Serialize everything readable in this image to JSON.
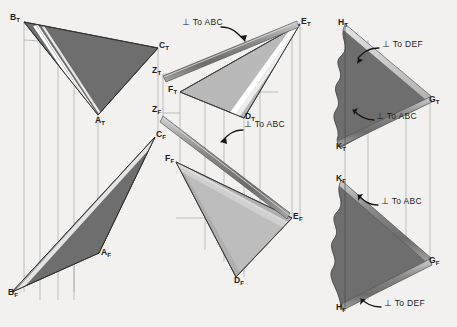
{
  "drawing": {
    "title": "Descriptive geometry: perpendicular planes orthographic projection",
    "background_color": "#f2f1ef",
    "ink_color": "#1d1d1d",
    "plane_fill_dark": "#6e6e6e",
    "plane_fill_light": "#b9b9b9",
    "edge_highlight": "#d9d9d9",
    "line_color": "#8f8f8f"
  },
  "views": {
    "left": {
      "name": "plane-abc",
      "top_view": {
        "name": "abc-top-view",
        "points": [
          {
            "label": "B",
            "sub": "T",
            "x": 16,
            "y": 17,
            "px": 24,
            "py": 22
          },
          {
            "label": "C",
            "sub": "T",
            "x": 160,
            "y": 45,
            "px": 158,
            "py": 48
          },
          {
            "label": "A",
            "sub": "T",
            "x": 99,
            "y": 111,
            "px": 98,
            "py": 115
          }
        ]
      },
      "front_view": {
        "name": "abc-front-view",
        "points": [
          {
            "label": "C",
            "sub": "F",
            "x": 157,
            "y": 134,
            "px": 155,
            "py": 137
          },
          {
            "label": "A",
            "sub": "F",
            "x": 102,
            "y": 250,
            "px": 99,
            "py": 253
          },
          {
            "label": "B",
            "sub": "F",
            "x": 16,
            "y": 290,
            "px": 12,
            "py": 292
          }
        ]
      }
    },
    "middle": {
      "name": "plane-def",
      "top_view": {
        "name": "def-top-view",
        "points": [
          {
            "label": "Z",
            "sub": "T",
            "x": 172,
            "y": 72,
            "px": 163,
            "py": 74
          },
          {
            "label": "F",
            "sub": "T",
            "x": 188,
            "y": 90,
            "px": 180,
            "py": 92
          },
          {
            "label": "E",
            "sub": "T",
            "x": 299,
            "y": 22,
            "px": 300,
            "py": 24
          },
          {
            "label": "D",
            "sub": "T",
            "x": 246,
            "y": 115,
            "px": 244,
            "py": 118
          },
          {
            "label": "Z",
            "sub": "F",
            "x": 172,
            "y": 111,
            "px": 163,
            "py": 113
          }
        ]
      },
      "front_view": {
        "name": "def-front-view",
        "points": [
          {
            "label": "C",
            "sub": "F",
            "x": 157,
            "y": 134,
            "px": 155,
            "py": 137
          },
          {
            "label": "F",
            "sub": "F",
            "x": 184,
            "y": 160,
            "px": 176,
            "py": 162
          },
          {
            "label": "E",
            "sub": "F",
            "x": 289,
            "y": 215,
            "px": 292,
            "py": 218
          },
          {
            "label": "D",
            "sub": "F",
            "x": 238,
            "y": 273,
            "px": 236,
            "py": 277
          }
        ]
      }
    },
    "right": {
      "name": "plane-ghk",
      "top_view": {
        "name": "ghk-top-view",
        "points": [
          {
            "label": "H",
            "sub": "T",
            "x": 350,
            "y": 26,
            "px": 345,
            "py": 26
          },
          {
            "label": "G",
            "sub": "T",
            "x": 429,
            "y": 98,
            "px": 430,
            "py": 99
          },
          {
            "label": "K",
            "sub": "T",
            "x": 346,
            "y": 145,
            "px": 341,
            "py": 147
          }
        ]
      },
      "front_view": {
        "name": "ghk-front-view",
        "points": [
          {
            "label": "K",
            "sub": "F",
            "x": 346,
            "y": 180,
            "px": 341,
            "py": 182
          },
          {
            "label": "G",
            "sub": "F",
            "x": 429,
            "y": 259,
            "px": 430,
            "py": 261
          },
          {
            "label": "H",
            "sub": "F",
            "x": 348,
            "y": 305,
            "px": 341,
            "py": 307
          }
        ]
      }
    }
  },
  "annotations": [
    {
      "id": "perp-abc-1",
      "text": "⊥ To ABC",
      "x": 182,
      "y": 22,
      "name": "note-perp-to-abc-top"
    },
    {
      "id": "perp-abc-2",
      "text": "⊥ To ABC",
      "x": 244,
      "y": 124,
      "name": "note-perp-to-abc-front"
    },
    {
      "id": "perp-def-1",
      "text": "⊥ To DEF",
      "x": 382,
      "y": 44,
      "name": "note-perp-to-def-top"
    },
    {
      "id": "perp-abc-3",
      "text": "⊥ To ABC",
      "x": 376,
      "y": 116,
      "name": "note-perp-to-abc-right-top"
    },
    {
      "id": "perp-abc-4",
      "text": "⊥ To ABC",
      "x": 381,
      "y": 201,
      "name": "note-perp-to-abc-right-front"
    },
    {
      "id": "perp-def-2",
      "text": "⊥ To DEF",
      "x": 384,
      "y": 303,
      "name": "note-perp-to-def-front"
    }
  ]
}
